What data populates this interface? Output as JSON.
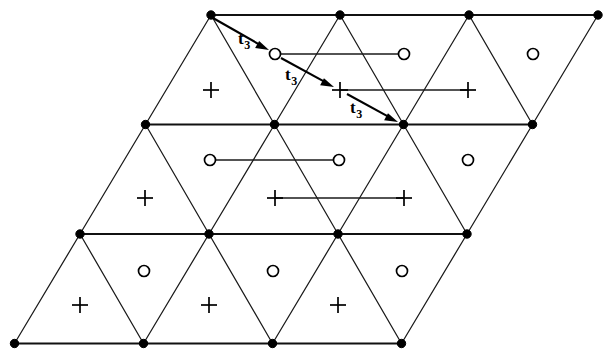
{
  "figure": {
    "background_color": "#ffffff",
    "line_color": "#1a1a1a",
    "marker_color": "#000000",
    "width": 612,
    "height": 361
  },
  "lattice": {
    "description": "Parallelogram-shaped triangular lattice, 3 rows by 3 columns of rhombic cells",
    "row_spacing_y": 109.5,
    "column_spacing_x": 129,
    "row_shear_x": -65,
    "vertex_rows": [
      {
        "row": 0,
        "y": 15,
        "x_positions": [
          211,
          340,
          469,
          598
        ]
      },
      {
        "row": 1,
        "y": 124.5,
        "x_positions": [
          145.5,
          274.5,
          403.5,
          532.5
        ]
      },
      {
        "row": 2,
        "y": 234,
        "x_positions": [
          80,
          209,
          338,
          467
        ]
      },
      {
        "row": 3,
        "y": 343.5,
        "x_positions": [
          14.5,
          143.5,
          272.5,
          401.5
        ]
      }
    ],
    "vertex_dot_radius": 4.2,
    "total_vertices": 16
  },
  "sublattice_sites": {
    "circle_label": "open-circle-site",
    "plus_label": "plus-site",
    "circle_radius": 5.5,
    "plus_arm": 8,
    "circles": [
      {
        "x": 275,
        "y": 54
      },
      {
        "x": 404,
        "y": 54
      },
      {
        "x": 533,
        "y": 54
      },
      {
        "x": 210,
        "y": 160
      },
      {
        "x": 339,
        "y": 160
      },
      {
        "x": 468,
        "y": 160
      },
      {
        "x": 144,
        "y": 271
      },
      {
        "x": 273,
        "y": 271
      },
      {
        "x": 402,
        "y": 271
      }
    ],
    "pluses": [
      {
        "x": 211,
        "y": 90
      },
      {
        "x": 340,
        "y": 90
      },
      {
        "x": 468,
        "y": 90
      },
      {
        "x": 145,
        "y": 198
      },
      {
        "x": 275,
        "y": 198
      },
      {
        "x": 404,
        "y": 198
      },
      {
        "x": 80,
        "y": 305
      },
      {
        "x": 209,
        "y": 305
      },
      {
        "x": 338,
        "y": 305
      }
    ]
  },
  "connectors": {
    "description": "Horizontal bond lines joining like sublattice sites",
    "segments": [
      {
        "name": "circle-connector-top",
        "x1": 275,
        "y1": 54,
        "x2": 404,
        "y2": 54
      },
      {
        "name": "plus-connector-top",
        "x1": 340,
        "y1": 90,
        "x2": 468,
        "y2": 90
      },
      {
        "name": "circle-connector-middle",
        "x1": 210,
        "y1": 160,
        "x2": 339,
        "y2": 160
      },
      {
        "name": "plus-connector-middle",
        "x1": 275,
        "y1": 198,
        "x2": 404,
        "y2": 198
      }
    ]
  },
  "vectors": {
    "label_text": "t",
    "label_subscript": "3",
    "full_label": "t3",
    "count": 3,
    "arrows": [
      {
        "name": "t3-arrow-1",
        "from": {
          "x": 213,
          "y": 18
        },
        "to": {
          "x": 269,
          "y": 50
        },
        "label_x": 238,
        "label_y": 44
      },
      {
        "name": "t3-arrow-2",
        "from": {
          "x": 281,
          "y": 58
        },
        "to": {
          "x": 334,
          "y": 87
        },
        "label_x": 285,
        "label_y": 80
      },
      {
        "name": "t3-arrow-3",
        "from": {
          "x": 347,
          "y": 94
        },
        "to": {
          "x": 398,
          "y": 122
        },
        "label_x": 350,
        "label_y": 113
      }
    ]
  }
}
